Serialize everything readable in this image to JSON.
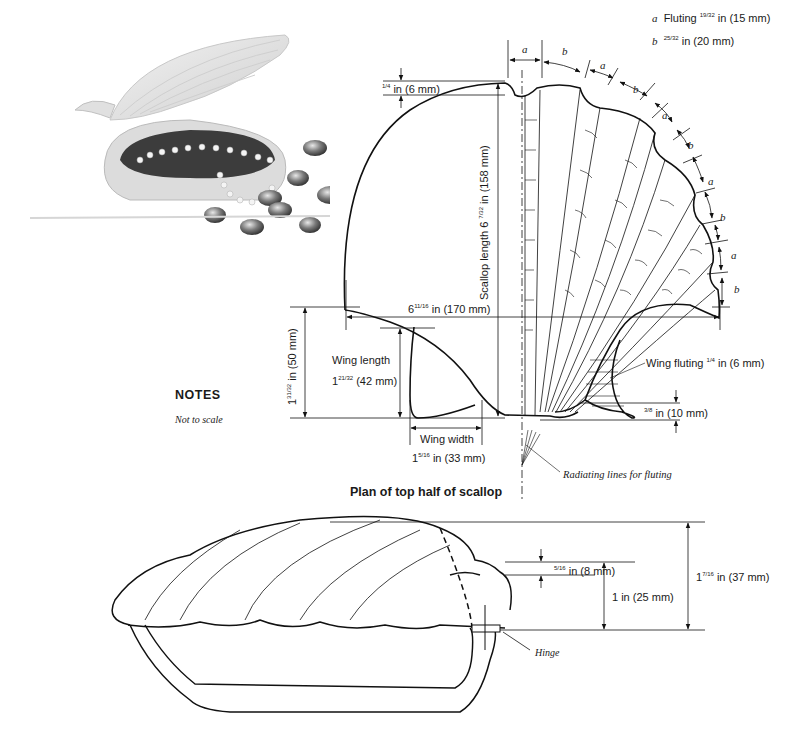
{
  "photo": {
    "alt": "Scallop-shell box filled with pearl necklaces and beads, with glass pebbles"
  },
  "legend": {
    "a": {
      "key": "a",
      "text": "Fluting",
      "fraction": "19/32",
      "value": "in (15 mm)"
    },
    "b": {
      "key": "b",
      "fraction": "25/32",
      "value": "in (20 mm)"
    }
  },
  "arc_labels": [
    "a",
    "b",
    "a",
    "b",
    "a",
    "b",
    "a",
    "b",
    "a",
    "b"
  ],
  "plan": {
    "title": "Plan of top half of scallop",
    "dims": {
      "top_notch": {
        "whole": "",
        "frac": "1/4",
        "text": "in (6 mm)"
      },
      "scallop_length": {
        "text": "Scallop length 6",
        "frac": "7/32",
        "unit": "in (158 mm)"
      },
      "width": {
        "whole": "6",
        "frac": "11/16",
        "text": "in (170 mm)"
      },
      "wing_total": {
        "whole": "1",
        "frac": "31/32",
        "text": "in (50 mm)"
      },
      "wing_length": {
        "label": "Wing length",
        "whole": "1",
        "frac": "21/32",
        "text": "(42 mm)"
      },
      "wing_width": {
        "label": "Wing width",
        "whole": "1",
        "frac": "5/16",
        "text": "in (33 mm)"
      },
      "wing_fluting": {
        "label": "Wing fluting",
        "frac": "1/4",
        "text": "in (6 mm)"
      },
      "base_offset": {
        "frac": "3/8",
        "text": "in (10 mm)"
      },
      "radiating": "Radiating lines for fluting"
    }
  },
  "notes": {
    "heading": "NOTES",
    "text": "Not to scale"
  },
  "side": {
    "lip": {
      "frac": "5/16",
      "text": "in (8 mm)"
    },
    "lid_height": {
      "text": "1 in (25 mm)"
    },
    "total_height": {
      "whole": "1",
      "frac": "7/16",
      "text": "in (37 mm)"
    },
    "hinge": "Hinge"
  }
}
